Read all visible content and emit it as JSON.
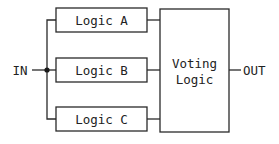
{
  "diagram": {
    "input_label": "IN",
    "output_label": "OUT",
    "logic_blocks": [
      {
        "label": "Logic A"
      },
      {
        "label": "Logic B"
      },
      {
        "label": "Logic C"
      }
    ],
    "voter": {
      "line1": "Voting",
      "line2": "Logic"
    },
    "colors": {
      "stroke": "#2a2a2a",
      "text": "#222222",
      "background": "#ffffff"
    }
  }
}
